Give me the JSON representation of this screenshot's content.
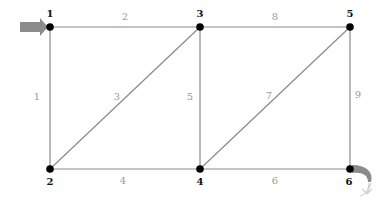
{
  "diagram": {
    "type": "truss-graph",
    "colors": {
      "edge": "#8a8a8a",
      "edge_label": "#9a9a9a",
      "node": "#000000",
      "node_label": "#111111",
      "load_arrow": "#8c8c8c",
      "support_arrow": "#8c8c8c"
    },
    "nodes": [
      {
        "id": "1",
        "label": "1",
        "x": 50,
        "y": 27
      },
      {
        "id": "2",
        "label": "2",
        "x": 50,
        "y": 169
      },
      {
        "id": "3",
        "label": "3",
        "x": 200,
        "y": 27
      },
      {
        "id": "4",
        "label": "4",
        "x": 200,
        "y": 169
      },
      {
        "id": "5",
        "label": "5",
        "x": 350,
        "y": 27
      },
      {
        "id": "6",
        "label": "6",
        "x": 350,
        "y": 169
      }
    ],
    "edges": [
      {
        "id": "1",
        "label": "1",
        "from": "1",
        "to": "2"
      },
      {
        "id": "2",
        "label": "2",
        "from": "1",
        "to": "3"
      },
      {
        "id": "3",
        "label": "3",
        "from": "2",
        "to": "3"
      },
      {
        "id": "4",
        "label": "4",
        "from": "2",
        "to": "4"
      },
      {
        "id": "5",
        "label": "5",
        "from": "3",
        "to": "4"
      },
      {
        "id": "6",
        "label": "6",
        "from": "4",
        "to": "6"
      },
      {
        "id": "7",
        "label": "7",
        "from": "4",
        "to": "5"
      },
      {
        "id": "8",
        "label": "8",
        "from": "3",
        "to": "5"
      },
      {
        "id": "9",
        "label": "9",
        "from": "5",
        "to": "6"
      }
    ],
    "annotations": [
      {
        "name": "input-arrow",
        "at_node": "1",
        "icon": "right-arrow-icon"
      },
      {
        "name": "output-curved-arrow",
        "at_node": "6",
        "icon": "curved-arrow-icon"
      }
    ]
  }
}
